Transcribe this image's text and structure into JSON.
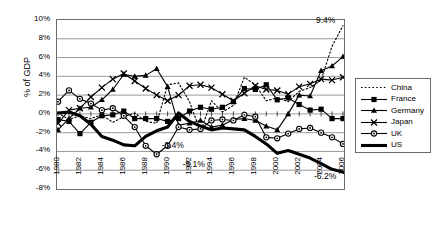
{
  "chart_data": {
    "type": "line",
    "title": "",
    "xlabel": "",
    "ylabel": "% of GDP",
    "ylim": [
      -8,
      10
    ],
    "ytick_labels": [
      "10%",
      "8%",
      "6%",
      "4%",
      "2%",
      "0%",
      "-2%",
      "-4%",
      "-6%",
      "-8%"
    ],
    "ytick_values": [
      10,
      8,
      6,
      4,
      2,
      0,
      -2,
      -4,
      -6,
      -8
    ],
    "grid": true,
    "legend_position": "right",
    "x": [
      1980,
      1981,
      1982,
      1983,
      1984,
      1985,
      1986,
      1987,
      1988,
      1989,
      1990,
      1991,
      1992,
      1993,
      1994,
      1995,
      1996,
      1997,
      1998,
      1999,
      2000,
      2001,
      2002,
      2003,
      2004,
      2005,
      2006
    ],
    "xtick_labels": [
      "1980",
      "1982",
      "1984",
      "1986",
      "1988",
      "1990",
      "1992",
      "1994",
      "1996",
      "1998",
      "2000",
      "2002",
      "2004",
      "2006"
    ],
    "series": [
      {
        "name": "China",
        "style": "dotted",
        "marker": "none",
        "values": [
          0.1,
          -0.6,
          -0.2,
          -0.5,
          -0.1,
          -0.9,
          -0.3,
          0.1,
          -0.8,
          -1.0,
          3.1,
          3.3,
          1.3,
          -1.9,
          1.4,
          0.2,
          0.9,
          3.9,
          3.1,
          1.4,
          1.7,
          1.3,
          2.4,
          2.8,
          3.6,
          7.2,
          9.4
        ]
      },
      {
        "name": "France",
        "style": "solid",
        "marker": "square",
        "values": [
          -0.6,
          -0.8,
          -2.1,
          -0.9,
          -0.2,
          -0.1,
          0.3,
          -0.5,
          -0.5,
          -0.5,
          -0.8,
          -0.5,
          0.3,
          0.7,
          0.5,
          0.7,
          1.3,
          2.7,
          2.6,
          3.1,
          1.5,
          1.7,
          1.0,
          0.4,
          0.5,
          -0.5,
          -0.5
        ]
      },
      {
        "name": "Germany",
        "style": "solid",
        "marker": "triangle",
        "values": [
          -1.7,
          -0.5,
          0.6,
          0.7,
          1.5,
          2.6,
          4.2,
          4.0,
          4.1,
          4.8,
          2.9,
          -1.2,
          -1.0,
          -0.7,
          -1.4,
          -1.2,
          -0.6,
          -0.5,
          -0.7,
          -1.3,
          -1.7,
          0.0,
          2.0,
          1.9,
          4.6,
          5.1,
          6.1
        ]
      },
      {
        "name": "Japan",
        "style": "solid",
        "marker": "x",
        "values": [
          -1.0,
          0.4,
          0.6,
          1.8,
          2.8,
          3.7,
          4.3,
          3.5,
          2.7,
          2.0,
          1.4,
          2.0,
          3.0,
          3.1,
          2.8,
          2.1,
          1.4,
          2.2,
          3.0,
          2.6,
          2.5,
          2.1,
          2.9,
          3.2,
          3.7,
          3.6,
          3.9
        ]
      },
      {
        "name": "UK",
        "style": "solid",
        "marker": "circle",
        "values": [
          1.3,
          2.5,
          1.6,
          1.1,
          0.4,
          0.6,
          -0.2,
          -1.4,
          -3.4,
          -4.3,
          -3.4,
          -1.4,
          -1.7,
          -1.6,
          -0.7,
          -0.6,
          -0.7,
          -0.1,
          -0.3,
          -2.5,
          -2.6,
          -2.1,
          -1.6,
          -1.5,
          -2.0,
          -2.5,
          -3.2
        ]
      },
      {
        "name": "US",
        "style": "solid-thick",
        "marker": "none",
        "values": [
          0.1,
          0.2,
          -0.2,
          -1.1,
          -2.4,
          -2.8,
          -3.3,
          -3.4,
          -2.4,
          -1.8,
          -1.4,
          0.1,
          -0.8,
          -1.3,
          -1.7,
          -1.5,
          -1.6,
          -1.7,
          -2.4,
          -3.2,
          -4.2,
          -3.9,
          -4.3,
          -4.7,
          -5.3,
          -5.9,
          -6.2
        ]
      }
    ],
    "annotations": [
      {
        "text": "9.4%",
        "x": 2006,
        "y": 9.4,
        "dx": -26,
        "dy": -9
      },
      {
        "text": "-3.4%",
        "x": 1989,
        "y": -3.4,
        "dx": 6,
        "dy": -4
      },
      {
        "text": "-5.1%",
        "x": 1991,
        "y": -5.1,
        "dx": 5,
        "dy": -1
      },
      {
        "text": "-6.2%",
        "x": 2006,
        "y": -6.2,
        "dx": -28,
        "dy": 1
      }
    ],
    "legend": [
      {
        "label": "China",
        "style": "dotted",
        "marker": "none"
      },
      {
        "label": "France",
        "style": "solid",
        "marker": "square"
      },
      {
        "label": "Germany",
        "style": "solid",
        "marker": "triangle"
      },
      {
        "label": "Japan",
        "style": "solid",
        "marker": "x"
      },
      {
        "label": "UK",
        "style": "solid",
        "marker": "circle"
      },
      {
        "label": "US",
        "style": "solid-thick",
        "marker": "none"
      }
    ],
    "colors": {
      "line": "#000000",
      "grid": "#808080",
      "axis": "#6b6b6b",
      "background": "#ffffff"
    }
  }
}
